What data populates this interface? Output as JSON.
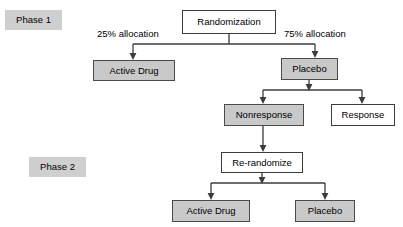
{
  "diagram": {
    "background_color": "#ffffff",
    "line_color": "#3c3c3c",
    "shaded_fill": "#c9c9c9",
    "plain_fill": "#ffffff",
    "phase_label_fill": "#cfcfcf",
    "phases": [
      {
        "id": "phase-1",
        "label": "Phase 1"
      },
      {
        "id": "phase-2",
        "label": "Phase 2"
      }
    ],
    "nodes": [
      {
        "id": "randomization",
        "label": "Randomization",
        "style": "plain"
      },
      {
        "id": "phase1-active-drug",
        "label": "Active Drug",
        "style": "shaded"
      },
      {
        "id": "phase1-placebo",
        "label": "Placebo",
        "style": "shaded"
      },
      {
        "id": "nonresponse",
        "label": "Nonresponse",
        "style": "shaded"
      },
      {
        "id": "response",
        "label": "Response",
        "style": "plain"
      },
      {
        "id": "re-randomize",
        "label": "Re-randomize",
        "style": "plain"
      },
      {
        "id": "phase2-active-drug",
        "label": "Active Drug",
        "style": "shaded"
      },
      {
        "id": "phase2-placebo",
        "label": "Placebo",
        "style": "shaded"
      }
    ],
    "edge_labels": [
      {
        "id": "allocation-25",
        "label": "25% allocation"
      },
      {
        "id": "allocation-75",
        "label": "75% allocation"
      }
    ]
  }
}
